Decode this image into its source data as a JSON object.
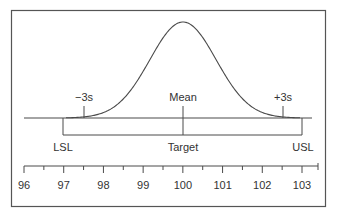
{
  "diagram": {
    "type": "process-capability-normal-curve",
    "colors": {
      "stroke": "#4a4a4a",
      "text": "#333333",
      "border": "#555555",
      "background": "#ffffff"
    },
    "curve_labels": {
      "minus3s": "−3s",
      "mean": "Mean",
      "plus3s": "+3s"
    },
    "spec_labels": {
      "lsl": "LSL",
      "target": "Target",
      "usl": "USL"
    },
    "spec_values": {
      "lsl": 97,
      "target": 100,
      "usl": 103
    },
    "distribution": {
      "mean": 100.0,
      "minus3s": 97.5,
      "plus3s": 102.5
    },
    "axis": {
      "min": 96,
      "max": 103.4,
      "major_ticks": [
        96,
        97,
        98,
        99,
        100,
        101,
        102,
        103
      ],
      "tick_labels": [
        "96",
        "97",
        "98",
        "99",
        "100",
        "101",
        "102",
        "103"
      ],
      "minor_step": 0.5
    }
  },
  "chart_data": {
    "type": "line",
    "title": "",
    "xlabel": "",
    "ylabel": "",
    "xlim": [
      96,
      103.4
    ],
    "x_ticks": [
      96,
      97,
      98,
      99,
      100,
      101,
      102,
      103
    ],
    "series": [
      {
        "name": "Normal distribution",
        "mean": 100.0,
        "minus3s": 97.5,
        "plus3s": 102.5
      }
    ],
    "annotations": [
      "−3s",
      "Mean",
      "+3s",
      "LSL",
      "Target",
      "USL"
    ],
    "spec_limits": {
      "LSL": 97,
      "Target": 100,
      "USL": 103
    },
    "grid": false,
    "legend": "none"
  }
}
